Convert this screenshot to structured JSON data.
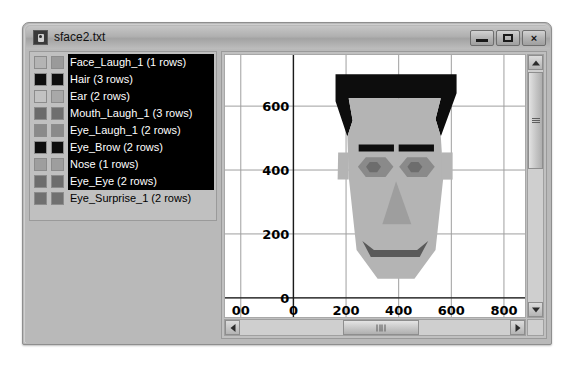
{
  "window": {
    "title": "sface2.txt",
    "icon": "file-icon",
    "controls": {
      "minimize": "minimize-icon",
      "maximize": "maximize-icon",
      "close": "×"
    }
  },
  "legend": {
    "items": [
      {
        "label": "Face_Laugh_1 (1 rows)",
        "name": "Face_Laugh_1",
        "rows": "1 rows",
        "swatch1": "#b4b4b4",
        "swatch2": "#9a9a9a",
        "selected": true
      },
      {
        "label": "Hair (3 rows)",
        "name": "Hair",
        "rows": "3 rows",
        "swatch1": "#0d0d0d",
        "swatch2": "#0d0d0d",
        "selected": true
      },
      {
        "label": "Ear (2 rows)",
        "name": "Ear",
        "rows": "2 rows",
        "swatch1": "#c2c2c2",
        "swatch2": "#a8a8a8",
        "selected": true
      },
      {
        "label": "Mouth_Laugh_1 (3 rows)",
        "name": "Mouth_Laugh_1",
        "rows": "3 rows",
        "swatch1": "#6a6a6a",
        "swatch2": "#6f6f6f",
        "selected": true
      },
      {
        "label": "Eye_Laugh_1 (2 rows)",
        "name": "Eye_Laugh_1",
        "rows": "2 rows",
        "swatch1": "#8a8a8a",
        "swatch2": "#8a8a8a",
        "selected": true
      },
      {
        "label": "Eye_Brow (2 rows)",
        "name": "Eye_Brow",
        "rows": "2 rows",
        "swatch1": "#0d0d0d",
        "swatch2": "#0d0d0d",
        "selected": true
      },
      {
        "label": "Nose (1 rows)",
        "name": "Nose",
        "rows": "1 rows",
        "swatch1": "#9e9e9e",
        "swatch2": "#9e9e9e",
        "selected": true
      },
      {
        "label": "Eye_Eye (2 rows)",
        "name": "Eye_Eye",
        "rows": "2 rows",
        "swatch1": "#6d6d6d",
        "swatch2": "#6d6d6d",
        "selected": true
      },
      {
        "label": "Eye_Surprise_1 (2 rows)",
        "name": "Eye_Surprise_1",
        "rows": "2 rows",
        "swatch1": "#707070",
        "swatch2": "#707070",
        "selected": false
      }
    ]
  },
  "chart_data": {
    "type": "scatter",
    "title": "",
    "xlabel": "",
    "ylabel": "",
    "xlim": [
      -260,
      880
    ],
    "ylim": [
      -60,
      760
    ],
    "xticks": [
      -200,
      0,
      200,
      400,
      600,
      800
    ],
    "xticklabels": [
      "00",
      "0",
      "200",
      "400",
      "600",
      "800"
    ],
    "yticks": [
      0,
      200,
      400,
      600
    ],
    "yticklabels": [
      "0",
      "200",
      "400",
      "600"
    ],
    "grid": true,
    "legend_position": "external-left",
    "shapes": [
      {
        "name": "Hair",
        "color": "#0d0d0d",
        "points": "160,700 620,700 620,640 560,505 540,560 560,625 210,625 225,555 205,505 160,615"
      },
      {
        "name": "Face_Laugh_1",
        "color": "#b4b4b4",
        "points": "205,505 225,555 210,625 560,625 540,560 560,505 570,380 540,150 460,60 320,60 240,150 210,380"
      },
      {
        "name": "Ear_left",
        "color": "#b4b4b4",
        "points": "210,455 170,455 168,370 210,370"
      },
      {
        "name": "Ear_right",
        "color": "#b4b4b4",
        "points": "563,455 605,455 605,370 563,370"
      },
      {
        "name": "Eye_Brow_left",
        "color": "#0d0d0d",
        "points": "248,480 382,480 382,458 248,458"
      },
      {
        "name": "Eye_Brow_right",
        "color": "#0d0d0d",
        "points": "400,480 534,480 534,458 400,458"
      },
      {
        "name": "Eye_Laugh_1_left",
        "color": "#8a8a8a",
        "points": "245,410 275,440 350,440 380,410 350,378 275,378"
      },
      {
        "name": "Eye_Laugh_1_right",
        "color": "#8a8a8a",
        "points": "402,410 432,440 507,440 537,410 507,378 432,378"
      },
      {
        "name": "Eye_Eye_left",
        "color": "#6d6d6d",
        "points": "290,425 318,425 333,410 318,393 290,393 276,410"
      },
      {
        "name": "Eye_Eye_right",
        "color": "#6d6d6d",
        "points": "447,425 475,425 490,410 475,393 447,393 433,410"
      },
      {
        "name": "Nose",
        "color": "#9e9e9e",
        "points": "390,365 338,230 448,230"
      },
      {
        "name": "Mouth_Laugh_1",
        "color": "#5a5a5a",
        "points": "262,178 294,128 480,128 512,178 470,150 306,150"
      }
    ]
  },
  "scrollbars": {
    "vertical": {
      "up": "scroll-up-arrow",
      "down": "scroll-down-arrow"
    },
    "horizontal": {
      "left": "scroll-left-arrow",
      "right": "scroll-right-arrow"
    }
  }
}
